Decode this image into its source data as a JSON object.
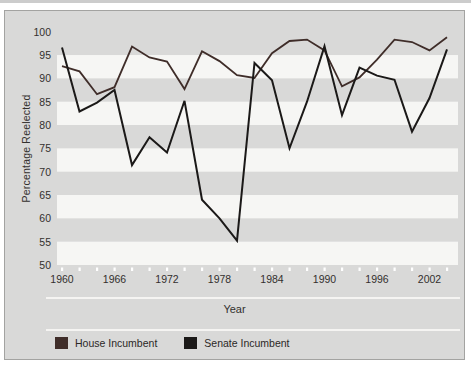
{
  "chart_data": {
    "type": "line",
    "title": "",
    "xlabel": "Year",
    "ylabel": "Percentage Reelected",
    "ylim": [
      50,
      100
    ],
    "yticks": [
      100,
      95,
      90,
      85,
      80,
      75,
      70,
      65,
      60,
      55,
      50
    ],
    "xticks_labeled": [
      1960,
      1966,
      1972,
      1978,
      1984,
      1990,
      1996,
      2002
    ],
    "xtick_minor_interval_years": 2,
    "grid": "horizontal striped bands, 5-unit tall, gray/white alternating",
    "legend_position": "bottom-left",
    "x": [
      1960,
      1962,
      1964,
      1966,
      1968,
      1970,
      1972,
      1974,
      1976,
      1978,
      1980,
      1982,
      1984,
      1986,
      1988,
      1990,
      1992,
      1994,
      1996,
      1998,
      2000,
      2002,
      2004
    ],
    "series": [
      {
        "name": "House Incumbent",
        "color": "#3f2d29",
        "values": [
          92.6,
          91.5,
          86.6,
          88.1,
          96.8,
          94.5,
          93.6,
          87.7,
          95.8,
          93.7,
          90.7,
          90.1,
          95.4,
          98.0,
          98.3,
          96.0,
          88.3,
          90.2,
          94.0,
          98.3,
          97.8,
          96.0,
          98.8
        ]
      },
      {
        "name": "Senate Incumbent",
        "color": "#1b1918",
        "values": [
          96.6,
          82.9,
          84.8,
          87.5,
          71.4,
          77.4,
          74.1,
          85.2,
          64.0,
          60.0,
          55.2,
          93.3,
          89.6,
          75.0,
          85.0,
          96.9,
          82.1,
          92.3,
          90.6,
          89.7,
          78.6,
          85.8,
          96.2
        ]
      }
    ]
  },
  "colors": {
    "panel_bg": "#d9d9d8",
    "stripe_white": "#f6f6f4",
    "panel_border": "#a3a3a1",
    "tick_dot": "#ffffff",
    "divider_rule": "#f5f4f2",
    "text": "#33302e"
  }
}
